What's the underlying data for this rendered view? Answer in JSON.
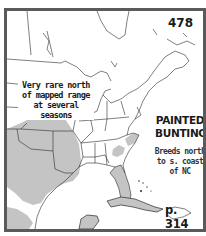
{
  "map": {
    "plate_number": "478",
    "species_name": "PAINTED BUNTING",
    "note": "Very rare north of mapped range at several seasons",
    "breeding_note": "Breeds north to s. coast of NC",
    "page_reference": "p. 314",
    "region": "Eastern North America",
    "colors": {
      "frame": "#5a5a5a",
      "range_fill": "#c4c4c4",
      "outline": "#2a2a2a",
      "background": "#ffffff"
    }
  }
}
